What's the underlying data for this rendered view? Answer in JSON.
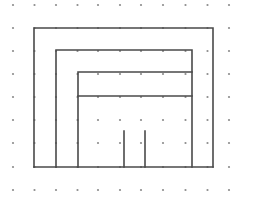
{
  "figure": {
    "canvas": {
      "width": 266,
      "height": 205,
      "background": "#ffffff"
    },
    "grid": {
      "name": "dot-grid",
      "dot_color": "#8c8c8c",
      "dot_radius": 1.1,
      "columns_x": [
        13,
        34.5,
        56,
        77.5,
        98,
        120,
        141,
        163,
        185.5,
        207.5,
        229
      ],
      "rows_y": [
        5,
        28,
        51,
        74,
        97,
        120,
        143,
        167,
        190
      ],
      "column_count": 11,
      "row_count": 9
    },
    "strokes": {
      "color": "#4a4a4a",
      "width": 1.6
    },
    "shapes": [
      {
        "name": "outer-rectangle",
        "type": "polyline",
        "points": "34,167 34,28 213,28 213,167"
      },
      {
        "name": "outer-bottom-edge",
        "type": "polyline",
        "points": "34,167 213,167"
      },
      {
        "name": "second-rectangle",
        "type": "polyline",
        "points": "56,167 56,50 192,50 192,167"
      },
      {
        "name": "third-rectangle",
        "type": "polyline",
        "points": "78,167 78,72 192,72"
      },
      {
        "name": "inner-horizontal-divider",
        "type": "polyline",
        "points": "78,96 192,96"
      },
      {
        "name": "stub-left",
        "type": "polyline",
        "points": "124,131 124,167"
      },
      {
        "name": "stub-right",
        "type": "polyline",
        "points": "145,131 145,167"
      }
    ]
  }
}
